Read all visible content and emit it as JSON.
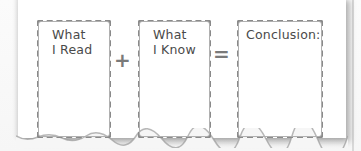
{
  "diagram": {
    "boxes": [
      {
        "line1": "What",
        "line2": "I Read"
      },
      {
        "line1": "What",
        "line2": "I Know"
      },
      {
        "line1": "Conclusion:",
        "line2": ""
      }
    ],
    "operators": {
      "plus": "+",
      "equals": "="
    },
    "colors": {
      "border": "#8a8a8a",
      "text": "#4a4a4a",
      "operator": "#7a7a7a",
      "paper": "#ffffff"
    }
  }
}
